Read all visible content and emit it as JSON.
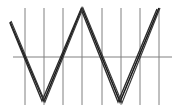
{
  "figure": {
    "title": "",
    "background_color": "#ffffff",
    "width": 181,
    "height": 112
  },
  "chart_data": {
    "type": "line",
    "title": "",
    "subtitle": "",
    "xlabel": "",
    "ylabel": "",
    "xlim": [
      0,
      181
    ],
    "ylim": [
      112,
      0
    ],
    "grid": true,
    "grid_orientation": "vertical",
    "grid_color": "#808080",
    "grid_line_width": 1,
    "grid_x_positions": [
      25,
      44,
      63,
      82,
      102,
      121,
      140,
      159
    ],
    "axis": {
      "name": "zero-axis",
      "orientation": "horizontal",
      "y": 57,
      "x_start": 13,
      "x_end": 172,
      "color": "#808080",
      "line_width": 1
    },
    "legend": null,
    "legend_position": "none",
    "annotations": [],
    "series": [
      {
        "name": "trace-1",
        "color": "#1a1a1a",
        "line_width": 1.6,
        "points": [
          {
            "x": 10,
            "y": 22
          },
          {
            "x": 44,
            "y": 101
          },
          {
            "x": 82,
            "y": 8
          },
          {
            "x": 120,
            "y": 102
          },
          {
            "x": 159,
            "y": 8
          }
        ]
      },
      {
        "name": "trace-2",
        "color": "#2b2b2b",
        "line_width": 1.4,
        "points": [
          {
            "x": 10,
            "y": 23
          },
          {
            "x": 42,
            "y": 101
          },
          {
            "x": 81,
            "y": 9
          },
          {
            "x": 118,
            "y": 102
          },
          {
            "x": 157,
            "y": 9
          }
        ]
      },
      {
        "name": "trace-3",
        "color": "#3a3a3a",
        "line_width": 1.2,
        "points": [
          {
            "x": 11,
            "y": 21
          },
          {
            "x": 45,
            "y": 102
          },
          {
            "x": 83,
            "y": 8
          },
          {
            "x": 122,
            "y": 103
          },
          {
            "x": 160,
            "y": 8
          }
        ]
      }
    ],
    "vertices_top": [
      {
        "label": "peak-1",
        "x": 82,
        "y": 8
      },
      {
        "label": "peak-2",
        "x": 159,
        "y": 8
      }
    ],
    "vertices_bottom": [
      {
        "label": "trough-1",
        "x": 44,
        "y": 101
      },
      {
        "label": "trough-2",
        "x": 120,
        "y": 102
      }
    ]
  }
}
